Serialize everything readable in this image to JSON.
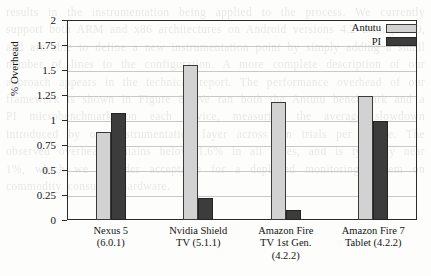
{
  "chart_data": {
    "type": "bar",
    "title": "",
    "xlabel": "",
    "ylabel": "% Overhead",
    "ylim": [
      0,
      2
    ],
    "grid": true,
    "legend_position": "top-right",
    "categories": [
      "Nexus 5\n(6.0.1)",
      "Nvidia Shield\nTV (5.1.1)",
      "Amazon Fire\nTV 1st Gen.\n(4.2.2)",
      "Amazon Fire 7\nTablet (4.2.2)"
    ],
    "ytick_labels": [
      "0",
      "0.25",
      "0.5",
      "0.75",
      "1",
      "1.25",
      "1.5",
      "1.75",
      "2"
    ],
    "ytick_values": [
      0,
      0.25,
      0.5,
      0.75,
      1,
      1.25,
      1.5,
      1.75,
      2
    ],
    "series": [
      {
        "name": "Antutu",
        "color": "#d2d2d2",
        "values": [
          0.88,
          1.55,
          1.18,
          1.24
        ]
      },
      {
        "name": "PI",
        "color": "#3c3c3c",
        "values": [
          1.07,
          0.22,
          0.1,
          0.99
        ]
      }
    ]
  },
  "background_text": "results in the instrumentation being applied to the process. We currently support both ARM and x86 architectures on Android versions 4.2 through 6.0, and are able to define a new instrumentation point by simply adding a small number of lines to the configuration. A more complete description of our approach appears in the technical report. The performance overhead of our framework is shown in Figure 8. We ran both the Antutu benchmark and a PI microbenchmark on each device, measuring the average slowdown introduced by our instrumentation layer across ten trials per device. The observed overhead remains below 1.6% in all cases, and is typically near 1%, which we consider acceptable for a deployed monitoring system on commodity consumer hardware."
}
